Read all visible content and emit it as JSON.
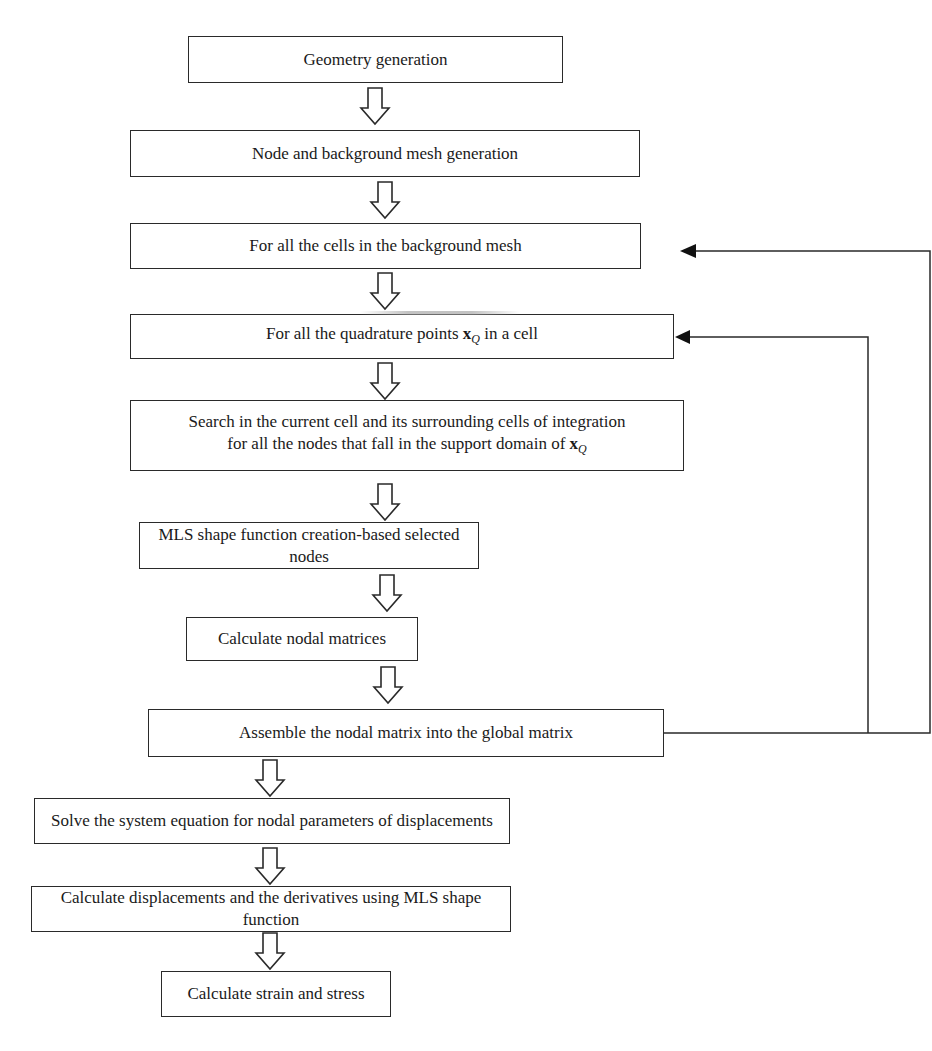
{
  "diagram": {
    "type": "flowchart",
    "steps": [
      {
        "id": "geometry",
        "label": "Geometry generation"
      },
      {
        "id": "node-mesh",
        "label": "Node and background mesh generation"
      },
      {
        "id": "cells-loop",
        "label": "For all the cells in the background mesh"
      },
      {
        "id": "quad-loop",
        "label_prefix": "For all the quadrature points ",
        "label_var": "x",
        "label_sub": "Q",
        "label_suffix": " in a cell"
      },
      {
        "id": "search",
        "line1": "Search in the current cell and its surrounding cells of integration",
        "line2_prefix": "for all the nodes that fall in the support domain of ",
        "line2_var": "x",
        "line2_sub": "Q"
      },
      {
        "id": "mls",
        "label": "MLS shape function creation-based selected nodes"
      },
      {
        "id": "nodal",
        "label": "Calculate nodal matrices"
      },
      {
        "id": "assemble",
        "label": "Assemble the nodal matrix into the global matrix"
      },
      {
        "id": "solve",
        "label": "Solve the system equation for nodal parameters of displacements"
      },
      {
        "id": "displacements",
        "label": "Calculate displacements and the derivatives using MLS shape function"
      },
      {
        "id": "strain",
        "label": "Calculate strain and stress"
      }
    ],
    "feedback_edges": [
      {
        "from": "assemble",
        "to": "cells-loop"
      },
      {
        "from": "assemble",
        "to": "quad-loop"
      }
    ],
    "colors": {
      "stroke": "#2a2a2a",
      "background": "#ffffff"
    }
  }
}
